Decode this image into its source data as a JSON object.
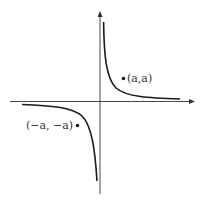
{
  "figure": {
    "points": [
      {
        "label": "(a,a)",
        "quadrant": "I"
      },
      {
        "label": "(−a, −a)",
        "quadrant": "III"
      }
    ],
    "colors": {
      "curve": "#1a1a1a",
      "axis": "#333333",
      "background": "#ffffff"
    }
  }
}
